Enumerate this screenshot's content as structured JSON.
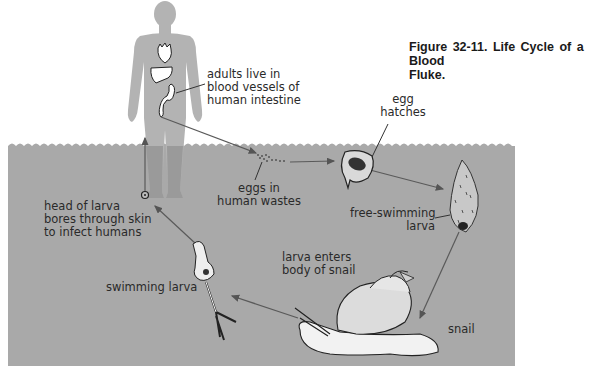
{
  "figure": {
    "caption_line1": "Figure 32-11.  Life Cycle of a Blood",
    "caption_line2": "Fluke."
  },
  "colors": {
    "water": "#a9a9a9",
    "human_silhouette": "#a8a8a8",
    "arrow": "#555555",
    "background": "#ffffff"
  },
  "labels": {
    "adults": [
      "adults live in",
      "blood vessels of",
      "human intestine"
    ],
    "eggs_wastes": [
      "eggs in",
      "human wastes"
    ],
    "egg_hatches": [
      "egg",
      "hatches"
    ],
    "free_swimming": [
      "free-swimming",
      "larva"
    ],
    "larva_enters": [
      "larva enters",
      "body of snail"
    ],
    "snail": "snail",
    "swimming_larva": "swimming larva",
    "head_of_larva": [
      "head of larva",
      "bores through skin",
      "to infect humans"
    ]
  }
}
